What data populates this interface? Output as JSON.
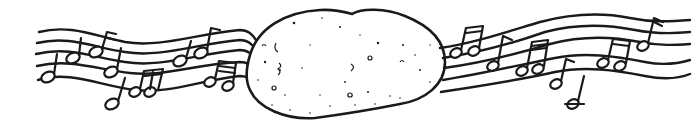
{
  "illustration": {
    "subject": "potato with music staves",
    "description": "Line drawing of a speckled potato in the center with wavy five-line music staves and notes extending to the left and right",
    "colors": {
      "ink": "#1a1a1a",
      "background": "#ffffff"
    },
    "left_staff": {
      "lines": 5,
      "notes": "quarter, eighth and beamed sixteenth notes"
    },
    "right_staff": {
      "lines": 5,
      "notes": "beamed eighth and sixteenth notes, flagged eighth notes, ledger-line note below"
    }
  }
}
